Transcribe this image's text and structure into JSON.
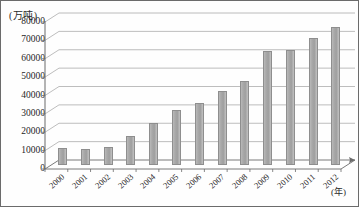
{
  "chart_data": {
    "type": "bar",
    "title": "",
    "ylabel": "(万吨)",
    "xlabel": "(年)",
    "categories": [
      "2000",
      "2001",
      "2002",
      "2003",
      "2004",
      "2005",
      "2006",
      "2007",
      "2008",
      "2009",
      "2010",
      "2011",
      "2012"
    ],
    "values": [
      9000,
      8500,
      10000,
      15500,
      23000,
      30000,
      33500,
      40000,
      45500,
      62000,
      62500,
      69000,
      75000
    ],
    "yticks": [
      "0",
      "10000",
      "20000",
      "30000",
      "40000",
      "50000",
      "60000",
      "70000",
      "80000"
    ],
    "ytick_values": [
      0,
      10000,
      20000,
      30000,
      40000,
      50000,
      60000,
      70000,
      80000
    ],
    "ylim": [
      0,
      80000
    ],
    "grid": true,
    "legend": "none",
    "series_color": "#a9a9a9",
    "axis_color": "#6b6b6b",
    "grid_color": "#8f8f8f"
  }
}
